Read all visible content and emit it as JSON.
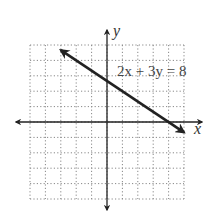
{
  "chart_data": {
    "type": "line",
    "title": "",
    "xlabel": "x",
    "ylabel": "y",
    "xlim": [
      -5,
      5
    ],
    "ylim": [
      -5,
      5
    ],
    "grid": true,
    "annotation": "2x + 3y = 8",
    "series": [
      {
        "name": "2x + 3y = 8",
        "x": [
          -3,
          5
        ],
        "y": [
          4.67,
          -0.67
        ],
        "arrows": "both"
      }
    ]
  }
}
